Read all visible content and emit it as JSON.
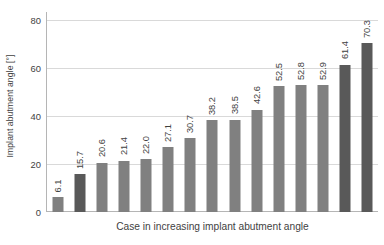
{
  "chart_data": {
    "type": "bar",
    "title": "",
    "subtitle": "",
    "xlabel": "Case in increasing implant abutment angle",
    "ylabel": "Implant abutment angle [°]",
    "ylim": [
      0,
      80
    ],
    "yticks": [
      0,
      20,
      40,
      60,
      80
    ],
    "ytick_labels": [
      "0",
      "20",
      "40",
      "60",
      "80"
    ],
    "grid": "horizontal",
    "legend": "none",
    "categories": [
      "1",
      "2",
      "3",
      "4",
      "5",
      "6",
      "7",
      "8",
      "9",
      "10",
      "11",
      "12",
      "13",
      "14",
      "15"
    ],
    "xtick_labels": [],
    "values": [
      6.1,
      15.7,
      20.6,
      21.4,
      22.0,
      27.1,
      30.7,
      38.2,
      38.5,
      42.6,
      52.5,
      52.8,
      52.9,
      61.4,
      70.3
    ],
    "data_labels": [
      "6.1",
      "15.7",
      "20.6",
      "21.4",
      "22.0",
      "27.1",
      "30.7",
      "38.2",
      "38.5",
      "42.6",
      "52.5",
      "52.8",
      "52.9",
      "61.4",
      "70.3"
    ],
    "data_label_rotation": -90,
    "bar_colors": [
      "#808080",
      "#595959",
      "#808080",
      "#808080",
      "#808080",
      "#808080",
      "#808080",
      "#808080",
      "#808080",
      "#808080",
      "#808080",
      "#808080",
      "#808080",
      "#595959",
      "#595959"
    ],
    "colors": {
      "bar_light": "#808080",
      "bar_dark": "#595959",
      "gridline": "#d9d9d9",
      "axis": "#b5b5b5",
      "text": "#3f3f3f",
      "background": "#ffffff"
    }
  }
}
